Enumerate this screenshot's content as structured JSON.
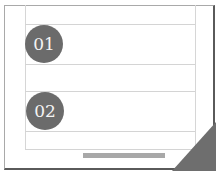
{
  "items": [
    {
      "number": "01"
    },
    {
      "number": "02"
    }
  ],
  "colors": {
    "badge": "#6b6b6b",
    "bar": "#a8a8a8",
    "corner": "#6e6e6e",
    "rule": "#d4d4d4"
  }
}
